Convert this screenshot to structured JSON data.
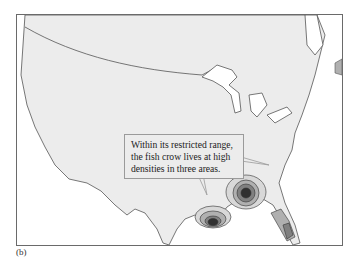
{
  "figure": {
    "panel_label": "(b)",
    "callout_text_lines": [
      "Within its restricted range,",
      "the fish crow lives at high",
      "densities in three areas."
    ],
    "map": {
      "region": "contiguous United States",
      "land_color": "#ececec",
      "water_color": "#ffffff",
      "border_color": "#555555",
      "density_colors": [
        "#d8d8d8",
        "#b0b0b0",
        "#808080",
        "#303030"
      ],
      "high_density_areas": [
        "Louisiana coast (Mississippi delta)",
        "Southwest Georgia / Florida panhandle",
        "Southern Florida"
      ]
    }
  }
}
